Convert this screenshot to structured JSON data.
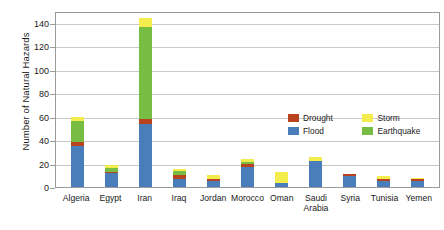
{
  "chart_data": {
    "type": "bar",
    "stacked": true,
    "title": "",
    "xlabel": "",
    "ylabel": "Number of Natural Hazards",
    "ylim": [
      0,
      150
    ],
    "yticks": [
      0,
      20,
      40,
      60,
      80,
      100,
      120,
      140
    ],
    "grid": true,
    "legend_position": "inside-upper-right",
    "categories": [
      "Algeria",
      "Egypt",
      "Iran",
      "Iraq",
      "Jordan",
      "Morocco",
      "Oman",
      "Saudi Arabia",
      "Syria",
      "Tunisia",
      "Yemen"
    ],
    "series": [
      {
        "name": "Flood",
        "color": "#4A7EBB",
        "values": [
          35,
          12,
          54,
          7,
          5,
          17,
          3,
          22,
          9,
          5,
          5
        ]
      },
      {
        "name": "Drought",
        "color": "#B8431E",
        "values": [
          3,
          1,
          4,
          3,
          2,
          3,
          0,
          0,
          2,
          2,
          2
        ]
      },
      {
        "name": "Earthquake",
        "color": "#77BC43",
        "values": [
          18,
          3,
          78,
          4,
          0,
          1,
          0,
          0,
          0,
          0,
          0
        ]
      },
      {
        "name": "Storm",
        "color": "#F2EC4C",
        "values": [
          4,
          3,
          8,
          1,
          3,
          3,
          10,
          4,
          0,
          2,
          1
        ]
      }
    ],
    "totals": [
      60,
      19,
      144,
      15,
      10,
      24,
      13,
      26,
      11,
      9,
      8
    ]
  },
  "legend": {
    "entries": [
      {
        "label": "Drought",
        "color": "#B8431E"
      },
      {
        "label": "Storm",
        "color": "#F2EC4C"
      },
      {
        "label": "Flood",
        "color": "#4A7EBB"
      },
      {
        "label": "Earthquake",
        "color": "#77BC43"
      }
    ]
  },
  "axis": {
    "y_title": "Number of Natural Hazards",
    "y_tick_labels": [
      "0",
      "20",
      "40",
      "60",
      "80",
      "100",
      "120",
      "140"
    ]
  },
  "colors": {
    "flood": "#4A7EBB",
    "drought": "#B8431E",
    "earthquake": "#77BC43",
    "storm": "#F2EC4C",
    "gridline": "#c8c8c8",
    "frame": "#9b9b9b",
    "text": "#1a1a1a"
  }
}
